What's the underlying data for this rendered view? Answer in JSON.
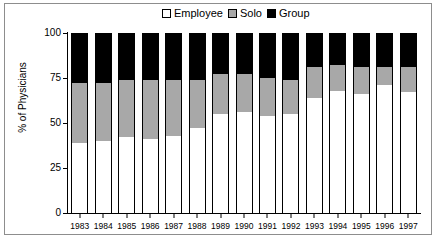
{
  "chart_data": {
    "type": "bar",
    "subtype": "stacked-bar-100",
    "title": "",
    "xlabel": "",
    "ylabel": "% of Physicians",
    "ylim": [
      0,
      100
    ],
    "yticks": [
      0,
      25,
      50,
      75,
      100
    ],
    "grid": false,
    "legend_position": "top-center",
    "categories": [
      "1983",
      "1984",
      "1985",
      "1986",
      "1987",
      "1988",
      "1989",
      "1990",
      "1991",
      "1992",
      "1993",
      "1994",
      "1995",
      "1996",
      "1997"
    ],
    "series": [
      {
        "name": "Employee",
        "color": "#ffffff",
        "values": [
          39,
          40,
          42,
          41,
          43,
          47,
          55,
          56,
          54,
          55,
          64,
          68,
          66,
          71,
          67
        ]
      },
      {
        "name": "Solo",
        "color": "#a8a8a8",
        "values": [
          33,
          32,
          32,
          33,
          31,
          27,
          22,
          21,
          21,
          19,
          17,
          14,
          15,
          10,
          14
        ]
      },
      {
        "name": "Group",
        "color": "#000000",
        "values": [
          28,
          28,
          26,
          26,
          26,
          26,
          23,
          23,
          25,
          26,
          19,
          18,
          19,
          19,
          19
        ]
      }
    ],
    "cumulative_tops": {
      "employee": [
        39,
        40,
        42,
        41,
        43,
        47,
        55,
        56,
        54,
        55,
        64,
        68,
        66,
        71,
        67
      ],
      "employee_plus_solo": [
        72,
        72,
        74,
        74,
        74,
        74,
        77,
        77,
        75,
        74,
        81,
        82,
        81,
        81,
        81
      ],
      "total": [
        100,
        100,
        100,
        100,
        100,
        100,
        100,
        100,
        100,
        100,
        100,
        100,
        100,
        100,
        100
      ]
    }
  },
  "legend": {
    "entries": [
      {
        "label": "Employee",
        "swatch": "white-square-icon"
      },
      {
        "label": "Solo",
        "swatch": "gray-square-icon"
      },
      {
        "label": "Group",
        "swatch": "black-square-icon"
      }
    ]
  },
  "axes": {
    "y_title": "% of Physicians",
    "y_tick_labels": [
      "100",
      "75",
      "50",
      "25",
      "0"
    ],
    "x_tick_labels": [
      "1983",
      "1984",
      "1985",
      "1986",
      "1987",
      "1988",
      "1989",
      "1990",
      "1991",
      "1992",
      "1993",
      "1994",
      "1995",
      "1996",
      "1997"
    ]
  },
  "colors": {
    "employee": "#ffffff",
    "solo": "#a8a8a8",
    "group": "#000000",
    "axis": "#000000",
    "frame": "#8d8d8d"
  }
}
